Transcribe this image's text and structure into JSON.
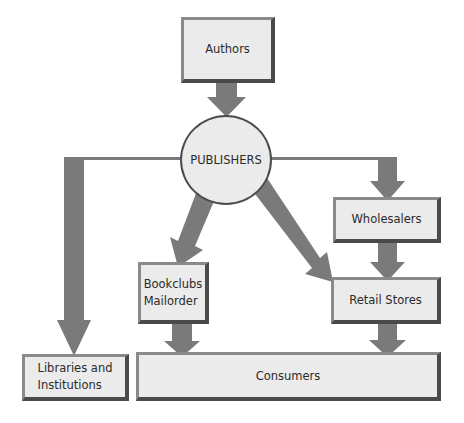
{
  "diagram": {
    "type": "flowchart",
    "title": "",
    "colors": {
      "box_fill": "#ebebeb",
      "box_border_light": "#8a8a8a",
      "box_border_dark": "#4a4a4a",
      "arrow": "#7a7a7a",
      "text": "#2a2a2a"
    },
    "nodes": {
      "authors": "Authors",
      "publishers": "PUBLISHERS",
      "wholesalers": "Wholesalers",
      "bookclubs": "Bookclubs\nMailorder",
      "retail": "Retail Stores",
      "libraries": "Libraries and\nInstitutions",
      "consumers": "Consumers"
    },
    "edges": [
      {
        "from": "Authors",
        "to": "PUBLISHERS"
      },
      {
        "from": "PUBLISHERS",
        "to": "Libraries and Institutions"
      },
      {
        "from": "PUBLISHERS",
        "to": "Bookclubs Mailorder"
      },
      {
        "from": "PUBLISHERS",
        "to": "Retail Stores"
      },
      {
        "from": "PUBLISHERS",
        "to": "Wholesalers"
      },
      {
        "from": "Wholesalers",
        "to": "Retail Stores"
      },
      {
        "from": "Bookclubs Mailorder",
        "to": "Consumers"
      },
      {
        "from": "Retail Stores",
        "to": "Consumers"
      }
    ]
  }
}
